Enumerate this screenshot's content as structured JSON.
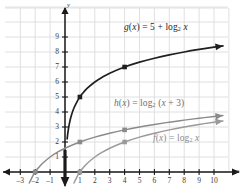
{
  "figure": {
    "background": "#ffffff",
    "grid_color": "#dcdcdc",
    "axis_color": "#1a1a1a"
  },
  "axes": {
    "x_label": "x",
    "y_label": "y",
    "x_ticks": [
      -3,
      -2,
      -1,
      1,
      2,
      3,
      4,
      5,
      6,
      7,
      8,
      9,
      10
    ],
    "y_ticks": [
      1,
      2,
      3,
      4,
      5,
      6,
      7,
      8,
      9
    ],
    "xlim": [
      -3.8,
      11.0
    ],
    "ylim": [
      -1.2,
      9.9
    ],
    "grid": true
  },
  "chart_data": {
    "type": "line",
    "title": "",
    "xlabel": "x",
    "ylabel": "y",
    "xlim": [
      -3.8,
      11.0
    ],
    "ylim": [
      -1.2,
      9.9
    ],
    "grid": true,
    "legend": "inline-annotations",
    "series": [
      {
        "name": "f",
        "label": "f(x) = log₂ x",
        "label_html": "<i>f</i>(<i>x</i>) = log<sub>2</sub> <i>x</i>",
        "expression": "log2(x)",
        "color": "#9a9a9a",
        "asymptote_x": 0,
        "points": [
          [
            1,
            0
          ],
          [
            4,
            2
          ]
        ],
        "x": [
          1,
          1.2,
          1.5,
          2,
          2.5,
          3,
          4,
          5,
          6,
          7,
          8,
          9,
          10,
          10.6
        ],
        "y": [
          0,
          0.263,
          0.585,
          1,
          1.322,
          1.585,
          2,
          2.322,
          2.585,
          2.807,
          3,
          3.17,
          3.322,
          3.406
        ]
      },
      {
        "name": "h",
        "label": "h(x) = log₂ (x + 3)",
        "label_html": "<i>h</i>(<i>x</i>) = log<sub>2</sub> (<i>x</i> + 3)",
        "expression": "log2(x + 3)",
        "color": "#8a8a8a",
        "asymptote_x": -3,
        "points": [
          [
            -2,
            0
          ],
          [
            1,
            2
          ],
          [
            4,
            2.807
          ]
        ],
        "x": [
          -2,
          -1.8,
          -1.5,
          -1,
          -0.5,
          0,
          1,
          2,
          3,
          4,
          5,
          6,
          7,
          8,
          9,
          10,
          10.6
        ],
        "y": [
          0,
          0.263,
          0.585,
          1,
          1.322,
          1.585,
          2,
          2.322,
          2.585,
          2.807,
          3,
          3.17,
          3.322,
          3.459,
          3.585,
          3.7,
          3.766
        ]
      },
      {
        "name": "g",
        "label": "g(x) = 5 + log₂ x",
        "label_html": "<i>g</i>(<i>x</i>) = 5 + log<sub>2</sub> <i>x</i>",
        "expression": "5 + log2(x)",
        "color": "#1f1f1f",
        "asymptote_x": 0,
        "points": [
          [
            1,
            5
          ],
          [
            4,
            7
          ]
        ],
        "x": [
          1,
          1.2,
          1.5,
          2,
          2.5,
          3,
          4,
          5,
          6,
          7,
          8,
          9,
          10,
          10.6
        ],
        "y": [
          5,
          5.263,
          5.585,
          6,
          6.322,
          6.585,
          7,
          7.322,
          7.585,
          7.807,
          8,
          8.17,
          8.322,
          8.406
        ]
      }
    ],
    "annotations": [
      {
        "text": "g(x) = 5 + log₂ x",
        "series": "g"
      },
      {
        "text": "h(x) = log₂ (x + 3)",
        "series": "h"
      },
      {
        "text": "f(x) = log₂ x",
        "series": "f"
      }
    ]
  }
}
